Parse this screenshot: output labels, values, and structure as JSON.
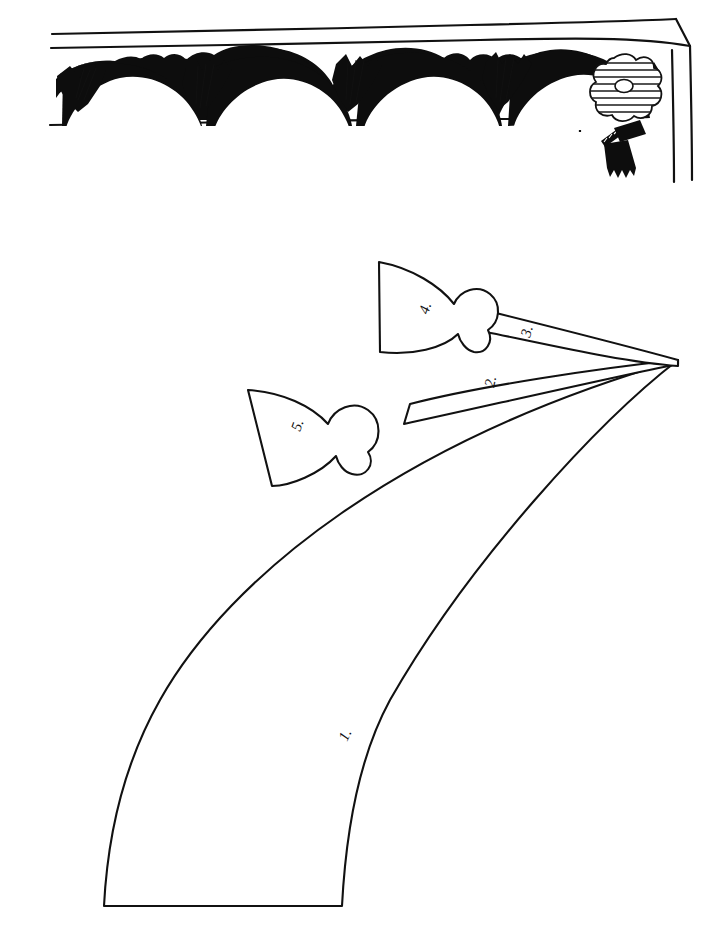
{
  "page": {
    "background_color": "#ffffff",
    "ink_color": "#111111",
    "width": 722,
    "height": 943
  },
  "illustration_top": {
    "name": "window-with-swag-valance",
    "description": "Window frame drawn in perspective with a scalloped swag valance, rosette and tassel",
    "frame": {
      "name": "window-frame",
      "style": "perspective corner, top rail and right jamb"
    },
    "swag_valance": {
      "name": "swag-valance",
      "swag_count": 5,
      "fringe_cluster_count": 6,
      "fill_color": "#0d0d0d"
    },
    "rosette": {
      "name": "rosette",
      "shape": "quatrefoil",
      "hatch_lines": 8,
      "center": "oval eyelet"
    },
    "tassel": {
      "name": "tassel",
      "parts": "twisted cord, head, skirt fringe",
      "fill_color": "#0d0d0d"
    }
  },
  "illustration_bottom": {
    "name": "pattern-pieces-layout",
    "description": "Five numbered pattern pieces radiating from a common apex at the right",
    "apex": {
      "x": 678,
      "y": 360
    },
    "hem_line": {
      "name": "hem-fold-line",
      "style": "dashed",
      "label": ""
    },
    "pieces": [
      {
        "id": "piece-1",
        "label": "1.",
        "shape": "large curved skirt panel",
        "label_x": 347,
        "label_y": 742
      },
      {
        "id": "piece-2",
        "label": "2.",
        "shape": "narrow tapered strip",
        "label_x": 494,
        "label_y": 386
      },
      {
        "id": "piece-3",
        "label": "3.",
        "shape": "narrow tapered strip",
        "label_x": 530,
        "label_y": 336
      },
      {
        "id": "piece-4",
        "label": "4.",
        "shape": "fan jabot with rounded bulb",
        "label_x": 428,
        "label_y": 313
      },
      {
        "id": "piece-5",
        "label": "5.",
        "shape": "fan jabot with rounded bulb",
        "label_x": 300,
        "label_y": 430
      }
    ]
  }
}
